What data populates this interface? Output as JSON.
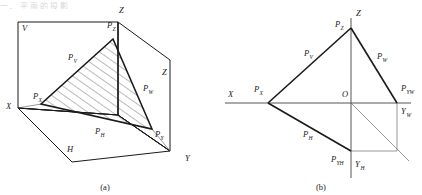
{
  "figure": {
    "title_partial_top": "一、平面的投影 ",
    "captions": {
      "a": "(a)",
      "b": "(b)"
    }
  },
  "panel_a": {
    "name": "pictorial-view",
    "axis_labels": [
      {
        "id": "Z-top",
        "text": "Z",
        "x": 119,
        "y": 13
      },
      {
        "id": "X-left",
        "text": "X",
        "x": 6,
        "y": 109
      },
      {
        "id": "Y-right",
        "text": "Y",
        "x": 185,
        "y": 161
      },
      {
        "id": "Z-right",
        "text": "Z",
        "x": 162,
        "y": 75
      }
    ],
    "plane_labels": [
      {
        "id": "V-plane",
        "text": "V",
        "x": 22,
        "y": 31
      },
      {
        "id": "H-plane",
        "text": "H",
        "x": 67,
        "y": 152
      }
    ],
    "trace_labels": [
      {
        "id": "P-Z",
        "base": "P",
        "sub": "Z",
        "x": 107,
        "y": 28
      },
      {
        "id": "P-V",
        "base": "P",
        "sub": "V",
        "x": 68,
        "y": 60
      },
      {
        "id": "P-X",
        "base": "P",
        "sub": "X",
        "x": 33,
        "y": 99
      },
      {
        "id": "P-W",
        "base": "P",
        "sub": "W",
        "x": 143,
        "y": 91
      },
      {
        "id": "P-H",
        "base": "P",
        "sub": "H",
        "x": 95,
        "y": 134
      },
      {
        "id": "P-Y",
        "base": "P",
        "sub": "Y",
        "x": 155,
        "y": 137
      }
    ]
  },
  "panel_b": {
    "name": "unfolded-view",
    "axis_labels": [
      {
        "id": "Z-axis",
        "text": "Z",
        "x": 145,
        "y": 16
      },
      {
        "id": "X-axis",
        "text": "X",
        "x": 17,
        "y": 97
      },
      {
        "id": "O-origin",
        "text": "O",
        "x": 141,
        "y": 93
      }
    ],
    "trace_labels": [
      {
        "id": "P-Z",
        "base": "P",
        "sub": "Z",
        "x": 124,
        "y": 27
      },
      {
        "id": "P-V",
        "base": "P",
        "sub": "V",
        "x": 93,
        "y": 56
      },
      {
        "id": "P-W",
        "base": "P",
        "sub": "W",
        "x": 166,
        "y": 59
      },
      {
        "id": "P-X",
        "base": "P",
        "sub": "X",
        "x": 43,
        "y": 92
      },
      {
        "id": "P-YW",
        "base": "P",
        "sub": "YW",
        "x": 192,
        "y": 91
      },
      {
        "id": "Y-W",
        "base": "Y",
        "sub": "W",
        "x": 195,
        "y": 110
      },
      {
        "id": "P-H",
        "base": "P",
        "sub": "H",
        "x": 95,
        "y": 137
      },
      {
        "id": "P-YH",
        "base": "P",
        "sub": "YH",
        "x": 123,
        "y": 159
      },
      {
        "id": "Y-H",
        "base": "Y",
        "sub": "H",
        "x": 146,
        "y": 163
      }
    ]
  },
  "colors": {
    "ink": "#1a1a1a",
    "thin": "#555555",
    "hatch": "#3a3a3a",
    "background": "#ffffff"
  }
}
